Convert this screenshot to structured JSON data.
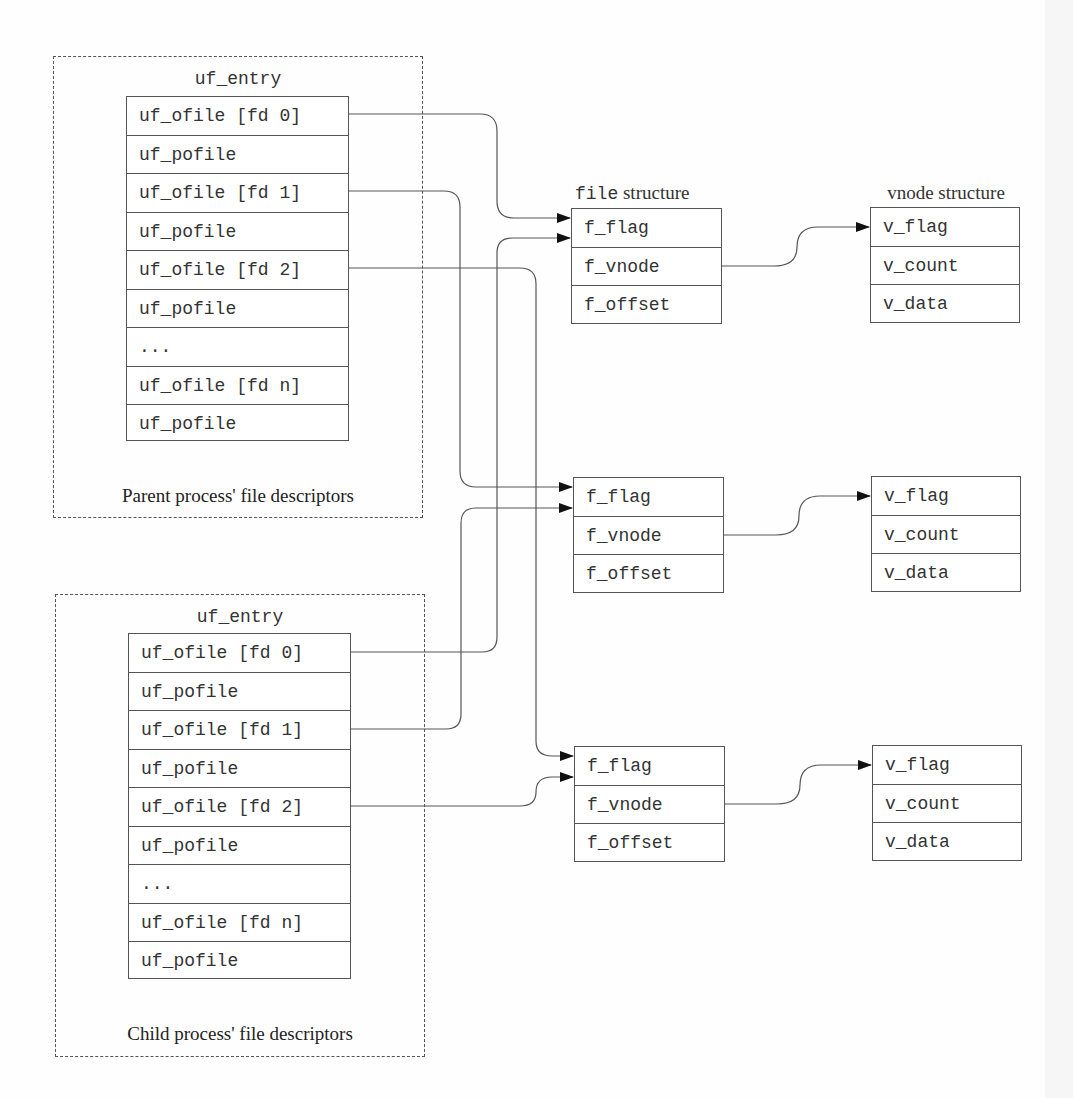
{
  "parent": {
    "caption": "Parent process' file descriptors",
    "table_title": "uf_entry",
    "rows": [
      "uf_ofile [fd 0]",
      "uf_pofile",
      "uf_ofile [fd 1]",
      "uf_pofile",
      "uf_ofile [fd 2]",
      "uf_pofile",
      "...",
      "uf_ofile [fd n]",
      "uf_pofile"
    ]
  },
  "child": {
    "caption": "Child process' file descriptors",
    "table_title": "uf_entry",
    "rows": [
      "uf_ofile [fd 0]",
      "uf_pofile",
      "uf_ofile [fd 1]",
      "uf_pofile",
      "uf_ofile [fd 2]",
      "uf_pofile",
      "...",
      "uf_ofile [fd n]",
      "uf_pofile"
    ]
  },
  "file_header": {
    "mono": "file",
    "serif": " structure"
  },
  "vnode_header": "vnode structure",
  "file_structs": [
    {
      "rows": [
        "f_flag",
        "f_vnode",
        "f_offset"
      ]
    },
    {
      "rows": [
        "f_flag",
        "f_vnode",
        "f_offset"
      ]
    },
    {
      "rows": [
        "f_flag",
        "f_vnode",
        "f_offset"
      ]
    }
  ],
  "vnode_structs": [
    {
      "rows": [
        "v_flag",
        "v_count",
        "v_data"
      ]
    },
    {
      "rows": [
        "v_flag",
        "v_count",
        "v_data"
      ]
    },
    {
      "rows": [
        "v_flag",
        "v_count",
        "v_data"
      ]
    }
  ]
}
